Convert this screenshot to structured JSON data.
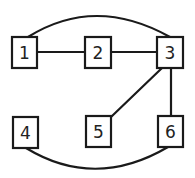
{
  "diagram": {
    "type": "graph",
    "nodes": [
      {
        "id": "1",
        "label": "1",
        "x": 12,
        "y": 37,
        "w": 25,
        "h": 31
      },
      {
        "id": "2",
        "label": "2",
        "x": 85,
        "y": 37,
        "w": 26,
        "h": 31
      },
      {
        "id": "3",
        "label": "3",
        "x": 157,
        "y": 37,
        "w": 26,
        "h": 31
      },
      {
        "id": "4",
        "label": "4",
        "x": 13,
        "y": 117,
        "w": 25,
        "h": 31
      },
      {
        "id": "5",
        "label": "5",
        "x": 86,
        "y": 116,
        "w": 25,
        "h": 31
      },
      {
        "id": "6",
        "label": "6",
        "x": 158,
        "y": 116,
        "w": 25,
        "h": 31
      }
    ],
    "edges": [
      {
        "from": "1",
        "to": "2",
        "shape": "straight"
      },
      {
        "from": "2",
        "to": "3",
        "shape": "straight"
      },
      {
        "from": "1",
        "to": "3",
        "shape": "arc-above"
      },
      {
        "from": "3",
        "to": "5",
        "shape": "straight"
      },
      {
        "from": "3",
        "to": "6",
        "shape": "straight"
      },
      {
        "from": "4",
        "to": "6",
        "shape": "arc-below"
      }
    ]
  }
}
